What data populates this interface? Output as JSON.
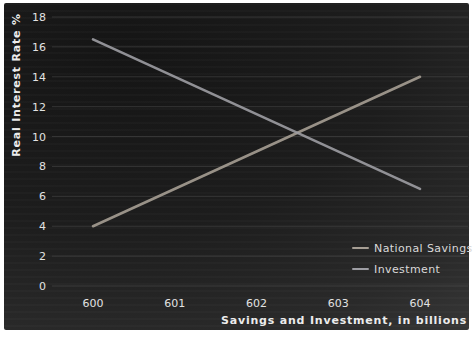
{
  "chart_data": {
    "type": "line",
    "title": "",
    "xlabel": "Savings and Investment, in billions",
    "ylabel": "Real Interest Rate %",
    "x_ticks": [
      600,
      601,
      602,
      603,
      604
    ],
    "y_ticks": [
      0,
      2,
      4,
      6,
      8,
      10,
      12,
      14,
      16,
      18
    ],
    "xlim": [
      600,
      604
    ],
    "ylim": [
      0,
      18
    ],
    "grid": "horizontal",
    "legend_position": "bottom-right",
    "background_color": "#222222",
    "text_color": "#e2e2e2",
    "gridline_color": "#5a5a5a",
    "series": [
      {
        "name": "National Savings",
        "x": [
          600,
          604
        ],
        "y": [
          4,
          14
        ],
        "color": "#a69e94"
      },
      {
        "name": "Investment",
        "x": [
          600,
          604
        ],
        "y": [
          16.5,
          6.5
        ],
        "color": "#9d9da3"
      }
    ],
    "crossing_point": {
      "x": 602.5,
      "y": 10.25
    }
  }
}
